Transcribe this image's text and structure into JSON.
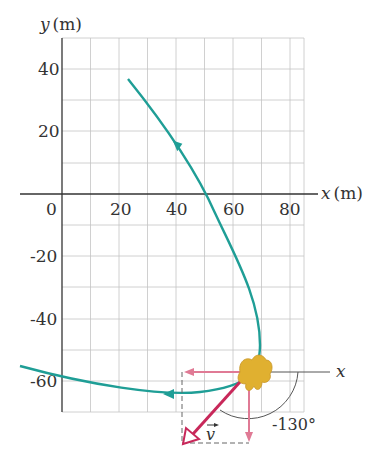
{
  "diagram": {
    "type": "trajectory-plot",
    "axes": {
      "y_label": "y (m)",
      "x_label": "x (m)",
      "y_label_var": "y",
      "x_label_var": "x",
      "unit": "(m)",
      "origin_label": "0",
      "x_ticks": [
        "20",
        "40",
        "60",
        "80"
      ],
      "y_ticks": [
        "40",
        "20",
        "-20",
        "-40",
        "-60"
      ]
    },
    "vector_diagram": {
      "x_axis_label": "x",
      "velocity_label": "v",
      "angle_label": "-130°"
    },
    "colors": {
      "path": "#1f9e96",
      "velocity": "#c8285a",
      "components": "#e07a95",
      "grid": "#bfbfbf",
      "axis": "#333333",
      "rabbit": "#e0b030"
    }
  }
}
